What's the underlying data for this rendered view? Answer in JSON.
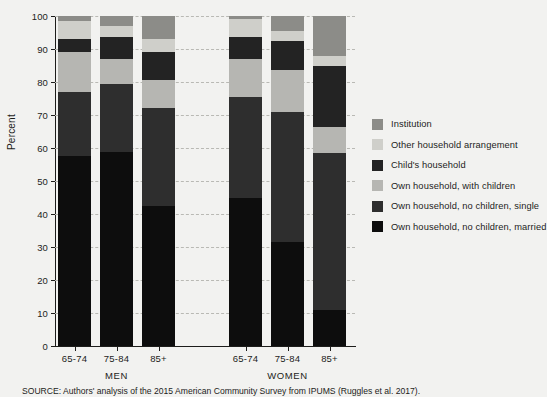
{
  "chart_data": {
    "type": "bar",
    "subtype": "stacked-bar-100",
    "title": "",
    "xlabel": "",
    "ylabel": "Percent",
    "ylim": [
      0,
      100
    ],
    "ytick_values": [
      0,
      10,
      20,
      30,
      40,
      50,
      60,
      70,
      80,
      90,
      100
    ],
    "ytick_labels": [
      "0",
      "10",
      "20",
      "30",
      "40",
      "50",
      "60",
      "70",
      "80",
      "90",
      "100"
    ],
    "grid": true,
    "grid_axis": "y",
    "legend_position": "right",
    "groups": [
      "MEN",
      "WOMEN"
    ],
    "categories": [
      "65-74",
      "75-84",
      "85+",
      "65-74",
      "75-84",
      "85+"
    ],
    "series": [
      {
        "name": "Own household, no children, married",
        "color": "#0d0d0d",
        "values": [
          57.5,
          58.8,
          42.3,
          45.0,
          31.5,
          11.0
        ]
      },
      {
        "name": "Own household, no children, single",
        "color": "#2e2e2e",
        "values": [
          19.5,
          20.7,
          29.7,
          30.5,
          39.3,
          47.5
        ]
      },
      {
        "name": "Own household, with children",
        "color": "#b6b6b2",
        "values": [
          12.0,
          7.5,
          8.5,
          11.5,
          12.7,
          8.0
        ]
      },
      {
        "name": "Child's household",
        "color": "#232323",
        "values": [
          4.0,
          6.5,
          8.5,
          6.5,
          9.0,
          18.5
        ]
      },
      {
        "name": "Other household arrangement",
        "color": "#cfcfca",
        "values": [
          5.5,
          3.5,
          4.0,
          5.5,
          3.0,
          3.0
        ]
      },
      {
        "name": "Institution",
        "color": "#8c8c88",
        "values": [
          1.5,
          3.0,
          7.0,
          1.0,
          4.5,
          12.0
        ]
      }
    ]
  },
  "legend": {
    "items": [
      {
        "label": "Institution",
        "color": "#8c8c88"
      },
      {
        "label": "Other household arrangement",
        "color": "#cfcfca"
      },
      {
        "label": "Child's household",
        "color": "#232323"
      },
      {
        "label": "Own household, with children",
        "color": "#b6b6b2"
      },
      {
        "label": "Own household, no children, single",
        "color": "#2e2e2e"
      },
      {
        "label": "Own household, no children, married",
        "color": "#0d0d0d"
      }
    ]
  },
  "axis": {
    "y_title": "Percent"
  },
  "group_labels": [
    "MEN",
    "WOMEN"
  ],
  "source": {
    "text": "SOURCE: Authors' analysis of the 2015 American Community Survey from IPUMS (Ruggles et al. 2017)."
  },
  "colors": {
    "background": "#f2f2f0",
    "axis": "#1d1d1b",
    "gridline": "#b9b9b4"
  }
}
